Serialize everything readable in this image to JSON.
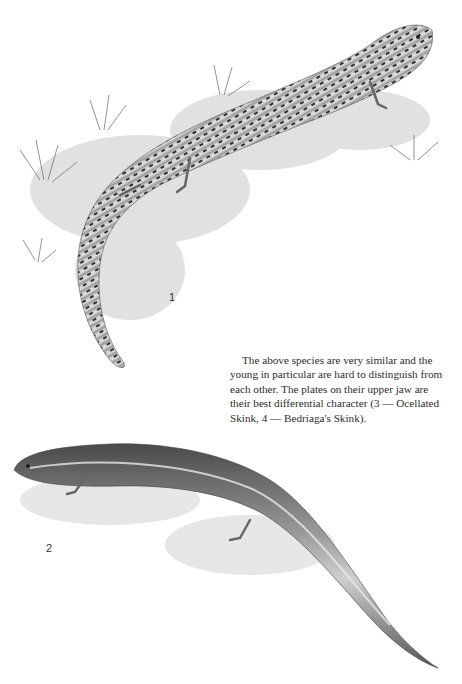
{
  "page": {
    "figures": [
      {
        "number": "1",
        "subject": "spotted skink illustration (figure 1)"
      },
      {
        "number": "2",
        "subject": "striped skink illustration (figure 2)"
      }
    ],
    "caption": "The above species are very similar and the young in particular are hard to distinguish from each other. The plates on their upper jaw are their best differential character (3 — Ocellated Skink, 4 — Bedriaga's Skink)."
  },
  "colors": {
    "background": "#ffffff",
    "ink": "#2c2c2c",
    "lizard_light": "#d9d9d9",
    "lizard_dark": "#3a3a3a"
  }
}
